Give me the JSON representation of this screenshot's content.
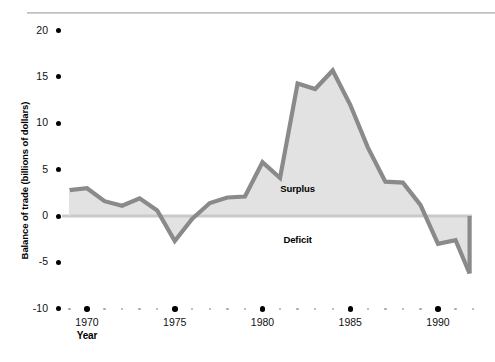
{
  "chart_data": {
    "type": "area",
    "title": "",
    "subtitle": "",
    "xlabel": "Year",
    "ylabel": "Balance of trade (billions of dollars)",
    "xlim": [
      1969,
      1991.8
    ],
    "ylim": [
      -10,
      20
    ],
    "grid": false,
    "legend_position": "none",
    "zero_baseline": 0,
    "x_tick_labels": [
      "1970",
      "1975",
      "1980",
      "1985",
      "1990"
    ],
    "x_tick_values": [
      1970,
      1975,
      1980,
      1985,
      1990
    ],
    "x_minor_interval": 1,
    "y_tick_labels": [
      "20",
      "15",
      "10",
      "5",
      "0",
      "-5",
      "-10"
    ],
    "y_tick_values": [
      20,
      15,
      10,
      5,
      0,
      -5,
      -10
    ],
    "annotations": [
      {
        "text": "Surplus",
        "x": 1982.0,
        "y": 2.9
      },
      {
        "text": "Deficit",
        "x": 1982.0,
        "y": -2.6
      }
    ],
    "series": [
      {
        "name": "Balance of trade",
        "x": [
          1969,
          1970,
          1971,
          1972,
          1973,
          1974,
          1975,
          1976,
          1977,
          1978,
          1979,
          1980,
          1981,
          1982,
          1983,
          1984,
          1985,
          1986,
          1987,
          1988,
          1989,
          1990,
          1991,
          1991.8
        ],
        "values": [
          2.8,
          3.0,
          1.6,
          1.1,
          1.9,
          0.6,
          -2.7,
          -0.3,
          1.4,
          2.0,
          2.1,
          5.8,
          4.1,
          14.3,
          13.7,
          15.7,
          12.0,
          7.4,
          3.7,
          3.6,
          1.2,
          -3.0,
          -2.6,
          -6.2
        ]
      }
    ],
    "colors": {
      "line": "#8a8a8a",
      "fill": "#e2e2e2",
      "baseline": "#c9c9c9",
      "tick_major": "#000000",
      "tick_minor": "#aaaaaa",
      "text": "#111111"
    }
  }
}
